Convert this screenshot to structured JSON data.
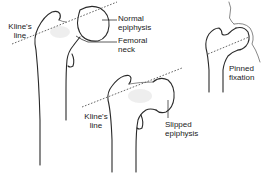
{
  "figure": {
    "panels": [
      {
        "id": "normal",
        "labels": {
          "kline": [
            "Kline's",
            "line"
          ],
          "epiphysis": [
            "Normal",
            "epiphysis"
          ],
          "neck": [
            "Femoral",
            "neck"
          ]
        }
      },
      {
        "id": "slipped",
        "labels": {
          "kline": [
            "Kline's",
            "line"
          ],
          "epiphysis": [
            "Slipped",
            "epiphysis"
          ]
        }
      },
      {
        "id": "pinned",
        "labels": {
          "fixation": [
            "Pinned",
            "fixation"
          ]
        }
      }
    ]
  },
  "colors": {
    "outline": "#2a2a2a",
    "dashed_line": "#555555",
    "text": "#222222",
    "background": "#ffffff"
  }
}
